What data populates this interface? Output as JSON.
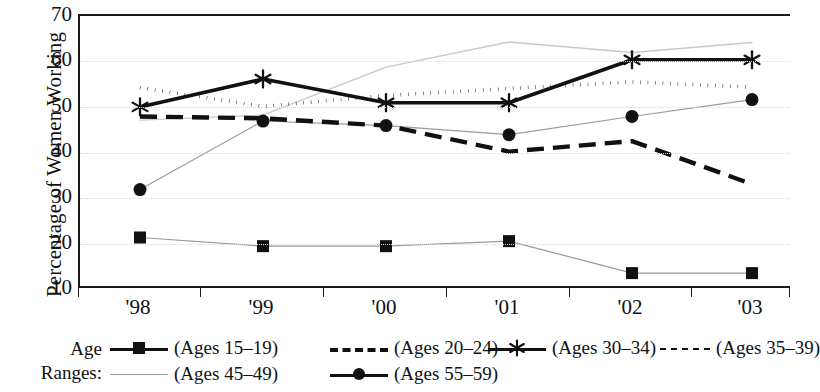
{
  "chart_data": {
    "type": "line",
    "title": "",
    "xlabel": "",
    "ylabel": "Percentage of Women Working",
    "categories": [
      "'98",
      "'99",
      "'00",
      "'01",
      "'02",
      "'03"
    ],
    "ylim": [
      10,
      70
    ],
    "yticks": [
      10,
      20,
      30,
      40,
      50,
      60,
      70
    ],
    "grid": "horizontal dotted gridlines at 20,30,40,50,60",
    "legend_position": "below axes, two rows, prefixed by 'Age Ranges:'",
    "series": [
      {
        "name": "(Ages 15–19)",
        "style": "thin solid line with filled square markers",
        "values": [
          21.5,
          19.6,
          19.6,
          20.7,
          13.7,
          13.7
        ]
      },
      {
        "name": "(Ages 20–24)",
        "style": "bold long-dashed line, no markers",
        "values": [
          48.0,
          47.6,
          46.0,
          40.3,
          42.6,
          33.2
        ]
      },
      {
        "name": "(Ages 30–34)",
        "style": "bold solid line with star (asterisk) markers",
        "values": [
          50.1,
          56.2,
          51.0,
          51.0,
          60.4,
          60.4
        ]
      },
      {
        "name": "(Ages 35–39)",
        "style": "bold dotted line, no markers",
        "values": [
          54.3,
          50.2,
          52.6,
          54.1,
          55.6,
          54.4
        ]
      },
      {
        "name": "(Ages 45–49)",
        "style": "thin light-grey solid line, no markers",
        "values": [
          47.2,
          48.3,
          58.8,
          64.3,
          62.0,
          64.2
        ]
      },
      {
        "name": "(Ages 55–59)",
        "style": "thin grey solid line with filled circle markers",
        "values": [
          32.0,
          47.0,
          46.0,
          44.0,
          48.0,
          51.7
        ]
      }
    ]
  },
  "axes": {
    "y_title": "Percentage of Women Working",
    "y_tick_labels": [
      "70",
      "60",
      "50",
      "40",
      "30",
      "20",
      "10"
    ],
    "x_tick_labels": [
      "'98",
      "'99",
      "'00",
      "'01",
      "'02",
      "'03"
    ]
  },
  "legend": {
    "head_line1": "Age",
    "head_line2": "Ranges:",
    "entries": [
      {
        "label": "(Ages 15–19)",
        "icon": "line-square-marker-icon"
      },
      {
        "label": "(Ages 20–24)",
        "icon": "line-long-dash-icon"
      },
      {
        "label": "(Ages 30–34)",
        "icon": "line-star-marker-icon"
      },
      {
        "label": "(Ages 35–39)",
        "icon": "line-short-dash-icon"
      },
      {
        "label": "(Ages 45–49)",
        "icon": "line-thin-grey-icon"
      },
      {
        "label": "(Ages 55–59)",
        "icon": "line-circle-marker-icon"
      }
    ]
  },
  "colors": {
    "ink": "#111111",
    "grid": "#d8d8dd",
    "grey_line": "#9a9a9a",
    "light_line": "#c9c9c9",
    "background": "#ffffff"
  }
}
